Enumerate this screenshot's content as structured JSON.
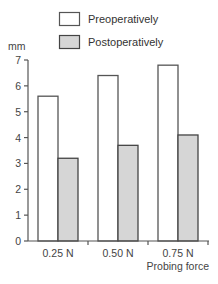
{
  "chart_data": {
    "type": "bar",
    "title": "",
    "xlabel": "Probing force",
    "ylabel": "mm",
    "ylim": [
      0,
      7
    ],
    "yticks": [
      0,
      1,
      2,
      3,
      4,
      5,
      6,
      7
    ],
    "grid": false,
    "legend_position": "top",
    "categories": [
      "0.25 N",
      "0.50 N",
      "0.75 N"
    ],
    "series": [
      {
        "name": "Preoperatively",
        "values": [
          5.6,
          6.4,
          6.8
        ],
        "color": "#ffffff",
        "stroke": "#555555"
      },
      {
        "name": "Postoperatively",
        "values": [
          3.2,
          3.7,
          4.1
        ],
        "color": "#d6d6d6",
        "stroke": "#444444"
      }
    ]
  },
  "legend": {
    "items": [
      {
        "label": "Preoperatively"
      },
      {
        "label": "Postoperatively"
      }
    ]
  },
  "axes": {
    "y_unit": "mm",
    "x_title": "Probing force"
  }
}
